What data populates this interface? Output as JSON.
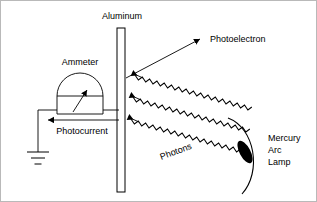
{
  "figure": {
    "background_color": "#ffffff",
    "line_color": "#000000",
    "border_color": "#b9b9b9",
    "width": 317,
    "height": 202
  },
  "labels": {
    "aluminum": "Aluminum",
    "photoelectron": "Photoelectron",
    "ammeter": "Ammeter",
    "photocurrent": "Photocurrent",
    "photons": "Photons",
    "mercury": "Mercury",
    "arc": "Arc",
    "lamp": "Lamp"
  },
  "components": {
    "plate": {
      "name": "aluminum-plate",
      "x": 117,
      "y": 28,
      "width": 8,
      "height": 164
    },
    "ammeter": {
      "name": "ammeter",
      "center_x": 80,
      "dome_radius": 23,
      "dome_base_y": 96,
      "box_bottom_y": 114,
      "needle_from": [
        74,
        112
      ],
      "needle_to": [
        88,
        89
      ]
    },
    "ground": {
      "name": "ground-symbol",
      "x": 38,
      "top_y": 114,
      "bars_y": [
        152,
        158,
        164
      ],
      "bar_widths": [
        22,
        14,
        7
      ]
    },
    "lamp": {
      "name": "mercury-arc-lamp",
      "ellipse_center": [
        245,
        152
      ],
      "ellipse_rx": 5,
      "ellipse_ry": 12,
      "ellipse_rotation_deg": -28,
      "ellipse_fill": "#000000"
    },
    "photon_beams": {
      "name": "photon-wave-lines",
      "count": 3,
      "arrow_end": "plate-side"
    }
  },
  "annotations": {
    "photoelectron_arrow": {
      "from": [
        126,
        78
      ],
      "to": [
        203,
        38
      ]
    },
    "photocurrent_arrow": {
      "from": [
        119,
        120
      ],
      "to": [
        46,
        120
      ]
    }
  }
}
